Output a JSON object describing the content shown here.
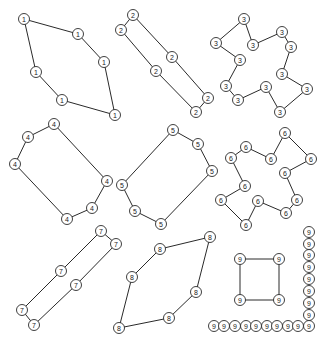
{
  "diagram": {
    "title": "",
    "node_radius": 5.5,
    "colors": {
      "line": "#2a2a2a",
      "node_fill": "#ffffff",
      "text": "#1a1a1a",
      "background": "#ffffff"
    },
    "clusters": [
      {
        "label": "1",
        "nodes": [
          [
            24,
            19
          ],
          [
            78,
            34
          ],
          [
            104,
            62
          ],
          [
            115,
            115
          ],
          [
            62,
            100
          ],
          [
            36,
            72
          ]
        ],
        "closed": true
      },
      {
        "label": "2",
        "nodes": [
          [
            133,
            15
          ],
          [
            172,
            57
          ],
          [
            208,
            98
          ],
          [
            196,
            112
          ],
          [
            156,
            71
          ],
          [
            121,
            30
          ]
        ],
        "closed": true
      },
      {
        "label": "3",
        "nodes": [
          [
            244,
            19
          ],
          [
            216,
            43
          ],
          [
            240,
            60
          ],
          [
            226,
            86
          ],
          [
            238,
            100
          ],
          [
            266,
            87
          ],
          [
            280,
            112
          ],
          [
            307,
            89
          ],
          [
            282,
            74
          ],
          [
            291,
            47
          ],
          [
            282,
            32
          ],
          [
            253,
            45
          ]
        ],
        "closed": true
      },
      {
        "label": "4",
        "nodes": [
          [
            54,
            124
          ],
          [
            107,
            181
          ],
          [
            92,
            208
          ],
          [
            67,
            219
          ],
          [
            15,
            164
          ],
          [
            28,
            137
          ]
        ],
        "closed": true
      },
      {
        "label": "5",
        "nodes": [
          [
            173,
            130
          ],
          [
            198,
            144
          ],
          [
            212,
            171
          ],
          [
            161,
            224
          ],
          [
            135,
            211
          ],
          [
            122,
            185
          ]
        ],
        "closed": true
      },
      {
        "label": "6",
        "nodes": [
          [
            285,
            133
          ],
          [
            271,
            159
          ],
          [
            246,
            147
          ],
          [
            231,
            158
          ],
          [
            245,
            186
          ],
          [
            221,
            200
          ],
          [
            246,
            225
          ],
          [
            258,
            201
          ],
          [
            286,
            213
          ],
          [
            297,
            200
          ],
          [
            285,
            173
          ],
          [
            311,
            159
          ]
        ],
        "closed": true
      },
      {
        "label": "7",
        "nodes": [
          [
            101,
            231
          ],
          [
            116,
            244
          ],
          [
            76,
            285
          ],
          [
            34,
            325
          ],
          [
            22,
            310
          ],
          [
            61,
            271
          ]
        ],
        "closed": true
      },
      {
        "label": "8",
        "nodes": [
          [
            210,
            237
          ],
          [
            196,
            292
          ],
          [
            169,
            318
          ],
          [
            119,
            328
          ],
          [
            132,
            277
          ],
          [
            160,
            249
          ]
        ],
        "closed": true
      },
      {
        "label": "9",
        "nodes": [
          [
            240,
            259
          ],
          [
            279,
            259
          ],
          [
            279,
            300
          ],
          [
            240,
            300
          ]
        ],
        "closed": true
      }
    ],
    "isolated_nodes": {
      "label": "9",
      "positions": [
        [
          309,
          232
        ],
        [
          309,
          244
        ],
        [
          309,
          255
        ],
        [
          309,
          267
        ],
        [
          309,
          279
        ],
        [
          309,
          291
        ],
        [
          309,
          303
        ],
        [
          309,
          315
        ],
        [
          214,
          326
        ],
        [
          224,
          326
        ],
        [
          235,
          326
        ],
        [
          246,
          326
        ],
        [
          256,
          326
        ],
        [
          267,
          326
        ],
        [
          277,
          326
        ],
        [
          288,
          326
        ],
        [
          298,
          326
        ],
        [
          309,
          326
        ]
      ]
    }
  }
}
